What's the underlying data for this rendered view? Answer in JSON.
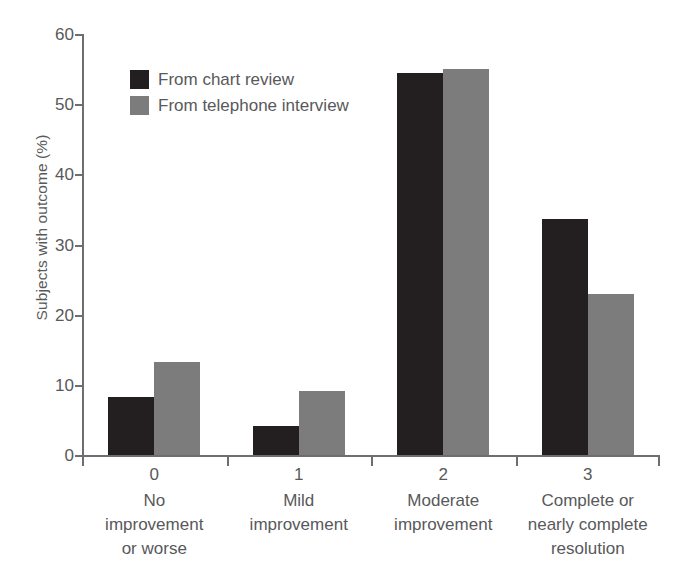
{
  "chart_data": {
    "type": "bar",
    "title": "",
    "xlabel": "",
    "ylabel": "Subjects with outcome (%)",
    "ylim": [
      0,
      60
    ],
    "yticks": [
      0,
      10,
      20,
      30,
      40,
      50,
      60
    ],
    "grid": false,
    "legend_position": "upper-left-inside",
    "categories": [
      "0",
      "1",
      "2",
      "3"
    ],
    "category_descriptions": [
      "No improvement or worse",
      "Mild improvement",
      "Moderate improvement",
      "Complete or nearly complete resolution"
    ],
    "series": [
      {
        "name": "From chart review",
        "color": "#231f20",
        "values": [
          8.2,
          4.2,
          54.4,
          33.6
        ]
      },
      {
        "name": "From telephone interview",
        "color": "#7c7c7c",
        "values": [
          13.3,
          9.1,
          55.0,
          22.9
        ]
      }
    ]
  },
  "axis": {
    "y_title": "Subjects with outcome (%)",
    "y_tick_labels": [
      "0",
      "10",
      "20",
      "30",
      "40",
      "50",
      "60"
    ]
  },
  "legend": {
    "items": [
      {
        "label": "From chart review",
        "swatch": "dark-square-swatch"
      },
      {
        "label": "From telephone interview",
        "swatch": "gray-square-swatch"
      }
    ]
  },
  "x_axis": {
    "groups": [
      {
        "number": "0",
        "line1": "No",
        "line2": "improvement",
        "line3": "or worse"
      },
      {
        "number": "1",
        "line1": "Mild",
        "line2": "improvement",
        "line3": ""
      },
      {
        "number": "2",
        "line1": "Moderate",
        "line2": "improvement",
        "line3": ""
      },
      {
        "number": "3",
        "line1": "Complete or",
        "line2": "nearly complete",
        "line3": "resolution"
      }
    ]
  },
  "colors": {
    "series_dark": "#231f20",
    "series_light": "#7c7c7c",
    "axis": "#6d6e71",
    "text": "#58595b",
    "background": "#ffffff"
  }
}
